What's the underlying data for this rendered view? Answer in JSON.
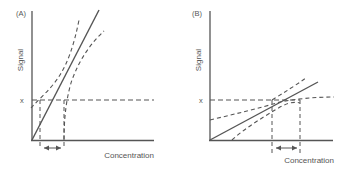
{
  "panels": [
    {
      "id": "A",
      "label": "(A)",
      "ylabel": "Signal",
      "xlabel": "Concentration",
      "level_label": "x"
    },
    {
      "id": "B",
      "label": "(B)",
      "ylabel": "Signal",
      "xlabel": "Concentration",
      "level_label": "x"
    }
  ],
  "colors": {
    "line": "#555555",
    "text": "#555555"
  }
}
